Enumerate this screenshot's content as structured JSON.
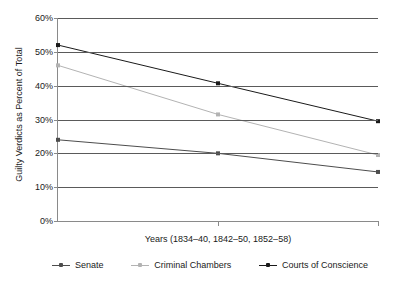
{
  "chart_data": {
    "type": "line",
    "title": "",
    "xlabel": "Years (1834–40, 1842–50, 1852–58)",
    "ylabel": "Guilty Verdicts as Percent of Total",
    "categories": [
      "1834–40",
      "1842–50",
      "1852–58"
    ],
    "ylim": [
      0,
      60
    ],
    "ytick_labels": [
      "0%",
      "10%",
      "20%",
      "30%",
      "40%",
      "50%",
      "60%"
    ],
    "ytick_values": [
      0,
      10,
      20,
      30,
      40,
      50,
      60
    ],
    "grid": true,
    "legend_position": "bottom",
    "series": [
      {
        "name": "Senate",
        "color": "#4d4d4d",
        "values": [
          24.0,
          20.0,
          14.5
        ]
      },
      {
        "name": "Criminal Chambers",
        "color": "#b3b3b3",
        "values": [
          46.0,
          31.5,
          19.5
        ]
      },
      {
        "name": "Courts of Conscience",
        "color": "#1a1a1a",
        "values": [
          52.0,
          40.7,
          29.5
        ]
      }
    ]
  },
  "legend": {
    "items": [
      {
        "label": "Senate",
        "marker": "line-with-square-marker"
      },
      {
        "label": "Criminal Chambers",
        "marker": "line-with-square-marker"
      },
      {
        "label": "Courts of Conscience",
        "marker": "line-with-square-marker"
      }
    ]
  }
}
